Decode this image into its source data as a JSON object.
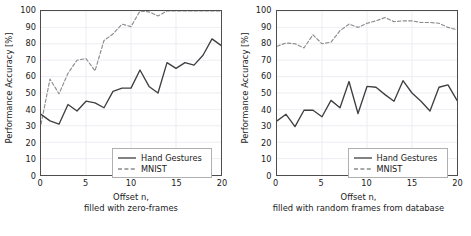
{
  "figure": {
    "background": "#ffffff",
    "series_colors": {
      "hand_gestures": "#3f3f3f",
      "mnist": "#8c8c8c"
    },
    "grid_color": "#e8e8f0",
    "axis_color": "#4d4d4d"
  },
  "chart_data": [
    {
      "type": "line",
      "panel": "left",
      "title": "",
      "xlabel": "Offset n,",
      "xlabel_line2": "filled with zero-frames",
      "ylabel": "Performance Accuracy [%]",
      "xlim": [
        0,
        20
      ],
      "ylim": [
        0,
        100
      ],
      "xticks": [
        0,
        5,
        10,
        15,
        20
      ],
      "yticks": [
        0,
        10,
        20,
        30,
        40,
        50,
        60,
        70,
        80,
        90,
        100
      ],
      "grid": true,
      "legend_position": "lower right",
      "x": [
        0,
        1,
        2,
        3,
        4,
        5,
        6,
        7,
        8,
        9,
        10,
        11,
        12,
        13,
        14,
        15,
        16,
        17,
        18,
        19,
        20
      ],
      "series": [
        {
          "name": "Hand Gestures",
          "style": "solid",
          "color": "#3f3f3f",
          "values": [
            37,
            33,
            31,
            43,
            39,
            45,
            44,
            41,
            51,
            53,
            53,
            64,
            54,
            50,
            68.5,
            65,
            68.5,
            67,
            73,
            83,
            79
          ]
        },
        {
          "name": "MNIST",
          "style": "dashed",
          "color": "#8c8c8c",
          "values": [
            31,
            58.5,
            49.5,
            62,
            70,
            71,
            63.5,
            82,
            86,
            92,
            90.5,
            100,
            99.5,
            97,
            100,
            100,
            100,
            100,
            100,
            100,
            100
          ]
        }
      ]
    },
    {
      "type": "line",
      "panel": "right",
      "title": "",
      "xlabel": "Offset n,",
      "xlabel_line2": "filled with random frames from database",
      "ylabel": "Performance Accuracy [%]",
      "xlim": [
        0,
        20
      ],
      "ylim": [
        0,
        100
      ],
      "xticks": [
        0,
        5,
        10,
        15,
        20
      ],
      "yticks": [
        0,
        10,
        20,
        30,
        40,
        50,
        60,
        70,
        80,
        90,
        100
      ],
      "grid": true,
      "legend_position": "lower right",
      "x": [
        0,
        1,
        2,
        3,
        4,
        5,
        6,
        7,
        8,
        9,
        10,
        11,
        12,
        13,
        14,
        15,
        16,
        17,
        18,
        19,
        20
      ],
      "series": [
        {
          "name": "Hand Gestures",
          "style": "solid",
          "color": "#3f3f3f",
          "values": [
            33,
            37,
            29.5,
            39.5,
            39.5,
            35.5,
            45.5,
            41,
            57,
            37.5,
            54,
            53.5,
            49,
            45,
            57.5,
            50,
            45,
            39,
            53.5,
            55,
            45.5
          ]
        },
        {
          "name": "MNIST",
          "style": "dashed",
          "color": "#8c8c8c",
          "values": [
            78.5,
            80.5,
            80,
            77.5,
            85.5,
            80,
            81,
            88,
            92,
            90,
            92.5,
            94,
            96,
            93.5,
            94,
            94,
            93,
            93,
            92.5,
            90,
            88.5
          ]
        }
      ]
    }
  ],
  "legend": {
    "hand_gestures_label": "Hand Gestures",
    "mnist_label": "MNIST"
  }
}
